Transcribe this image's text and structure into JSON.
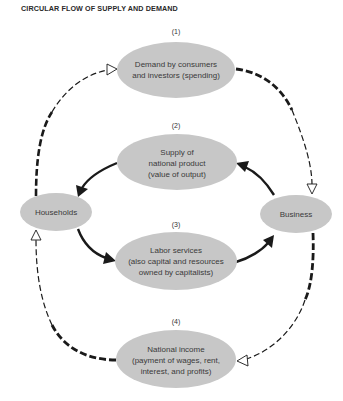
{
  "title": "CIRCULAR FLOW OF SUPPLY AND DEMAND",
  "colors": {
    "node_fill": "#c7c7c7",
    "line": "#1a1a1a",
    "text": "#3a3a3a",
    "background": "#ffffff"
  },
  "nodes": [
    {
      "id": "demand",
      "number": "(1)",
      "lines": [
        "Demand by consumers",
        "and investors (spending)"
      ]
    },
    {
      "id": "supply",
      "number": "(2)",
      "lines": [
        "Supply of",
        "national product",
        "(value of output)"
      ]
    },
    {
      "id": "labor",
      "number": "(3)",
      "lines": [
        "Labor services",
        "(also capital and resources",
        "owned by capitalists)"
      ]
    },
    {
      "id": "income",
      "number": "(4)",
      "lines": [
        "National income",
        "(payment of wages, rent,",
        "interest, and profits)"
      ]
    },
    {
      "id": "households",
      "number": "",
      "lines": [
        "Households"
      ]
    },
    {
      "id": "business",
      "number": "",
      "lines": [
        "Business"
      ]
    }
  ],
  "edges": [
    {
      "from": "households",
      "to": "demand",
      "style": "dashed",
      "arrowhead": "hollow"
    },
    {
      "from": "demand",
      "to": "business",
      "style": "dashed",
      "arrowhead": "hollow"
    },
    {
      "from": "supply",
      "to": "households",
      "style": "solid",
      "arrowhead": "filled"
    },
    {
      "from": "households",
      "to": "labor",
      "style": "solid",
      "arrowhead": "filled"
    },
    {
      "from": "labor",
      "to": "business",
      "style": "solid",
      "arrowhead": "filled"
    },
    {
      "from": "business",
      "to": "supply",
      "style": "solid",
      "arrowhead": "filled"
    },
    {
      "from": "business",
      "to": "income",
      "style": "dashed",
      "arrowhead": "hollow"
    },
    {
      "from": "income",
      "to": "households",
      "style": "dashed",
      "arrowhead": "hollow"
    }
  ]
}
